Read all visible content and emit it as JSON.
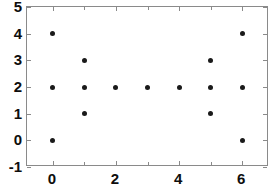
{
  "chart_data": {
    "type": "scatter",
    "title": "",
    "xlabel": "",
    "ylabel": "",
    "xlim": [
      -0.82,
      6.85
    ],
    "ylim": [
      -1,
      5
    ],
    "grid": false,
    "legend": null,
    "x_ticks": [
      0,
      2,
      4,
      6
    ],
    "x_tick_labels": [
      "0",
      "2",
      "4",
      "6"
    ],
    "x_minor_ticks": [
      1,
      3,
      5
    ],
    "y_ticks": [
      -1,
      0,
      1,
      2,
      3,
      4,
      5
    ],
    "y_tick_labels": [
      "-1",
      "0",
      "1",
      "2",
      "3",
      "4",
      "5"
    ],
    "marker": "filled-circle",
    "marker_color": "#1a1a1a",
    "marker_size": 5,
    "points": [
      {
        "x": 0,
        "y": 4
      },
      {
        "x": 0,
        "y": 2
      },
      {
        "x": 0,
        "y": 0
      },
      {
        "x": 1,
        "y": 3
      },
      {
        "x": 1,
        "y": 2
      },
      {
        "x": 1,
        "y": 1
      },
      {
        "x": 2,
        "y": 2
      },
      {
        "x": 3,
        "y": 2
      },
      {
        "x": 4,
        "y": 2
      },
      {
        "x": 5,
        "y": 3
      },
      {
        "x": 5,
        "y": 2
      },
      {
        "x": 5,
        "y": 1
      },
      {
        "x": 6,
        "y": 4
      },
      {
        "x": 6,
        "y": 2
      },
      {
        "x": 6,
        "y": 0
      }
    ],
    "series": [
      {
        "name": "points",
        "x": [
          0,
          0,
          0,
          1,
          1,
          1,
          2,
          3,
          4,
          5,
          5,
          5,
          6,
          6,
          6
        ],
        "values": [
          4,
          2,
          0,
          3,
          2,
          1,
          2,
          2,
          2,
          3,
          2,
          1,
          4,
          2,
          0
        ]
      }
    ]
  },
  "figure": {
    "background_color": "#ffffff",
    "frame_color": "#8a8a8a",
    "tick_color": "#8a8a8a",
    "label_color": "#0d0d0d"
  }
}
